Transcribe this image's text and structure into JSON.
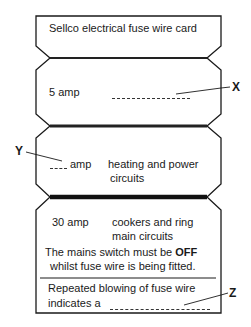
{
  "card": {
    "title": "Sellco electrical fuse wire card",
    "section1": {
      "rating": "5 amp"
    },
    "section2": {
      "rating_suffix": "amp",
      "use_line1": "heating and power",
      "use_line2": "circuits"
    },
    "section3": {
      "rating": "30 amp",
      "use_line1": "cookers and ring",
      "use_line2": "main circuits",
      "warning_pre": "The mains switch must be ",
      "warning_bold": "OFF",
      "warning_line2": "whilst fuse wire is being fitted.",
      "note_line1": "Repeated blowing of fuse wire",
      "note_line2": "indicates a"
    }
  },
  "labels": {
    "x": "X",
    "y": "Y",
    "z": "Z"
  },
  "colors": {
    "ink": "#1a1a1a",
    "wire": "#222222",
    "paper": "#ffffff"
  }
}
